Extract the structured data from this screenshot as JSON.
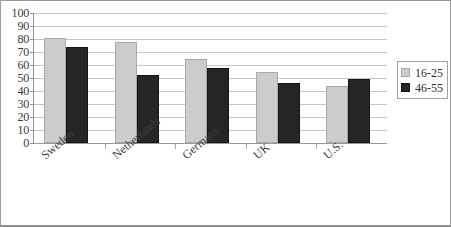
{
  "chart_data": {
    "type": "bar",
    "title": "",
    "subtitle": "",
    "xlabel": "",
    "ylabel": "",
    "ylim": [
      0,
      100
    ],
    "ytick_step": 10,
    "yticks": [
      "100",
      "90",
      "80",
      "70",
      "60",
      "50",
      "40",
      "30",
      "20",
      "10",
      "0"
    ],
    "grid": true,
    "legend_position": "right",
    "categories": [
      "Sweden",
      "Netherlands",
      "Germany",
      "UK",
      "U.S."
    ],
    "series": [
      {
        "name": "16-25",
        "color": "#cccccc",
        "values": [
          81,
          78,
          65,
          55,
          44
        ]
      },
      {
        "name": "46-55",
        "color": "#262626",
        "values": [
          74,
          52,
          58,
          46,
          49
        ]
      }
    ]
  },
  "legend": {
    "entries": [
      {
        "label": "16-25"
      },
      {
        "label": "46-55"
      }
    ]
  }
}
